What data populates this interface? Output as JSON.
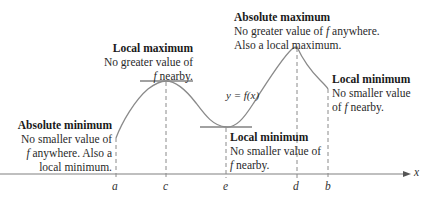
{
  "diagram": {
    "curve_label": "y = f(x)",
    "axis_label": "x",
    "ticks": [
      {
        "label": "a",
        "x": 116
      },
      {
        "label": "c",
        "x": 166
      },
      {
        "label": "e",
        "x": 226
      },
      {
        "label": "d",
        "x": 297
      },
      {
        "label": "b",
        "x": 328
      }
    ],
    "annotations": {
      "absolute_maximum": {
        "title": "Absolute maximum",
        "line1": "No greater value of ",
        "f": "f",
        "line1_end": " anywhere.",
        "line2": "Also a local maximum."
      },
      "local_maximum": {
        "title": "Local maximum",
        "line1": "No greater value of",
        "f": "f",
        "line2_end": " nearby."
      },
      "absolute_minimum": {
        "title": "Absolute minimum",
        "line1": "No smaller value of",
        "f": "f",
        "line2_end": " anywhere. Also a",
        "line3": "local minimum."
      },
      "local_minimum_middle": {
        "title": "Local minimum",
        "line1": "No smaller value of",
        "f": "f",
        "line2_end": " nearby."
      },
      "local_minimum_right": {
        "title": "Local minimum",
        "line1": "No smaller value",
        "line2_start": "of ",
        "f": "f",
        "line2_end": " nearby."
      }
    },
    "colors": {
      "curve": "#8a8a8a",
      "axis": "#7a7a7a",
      "text": "#2a2a2a"
    }
  }
}
